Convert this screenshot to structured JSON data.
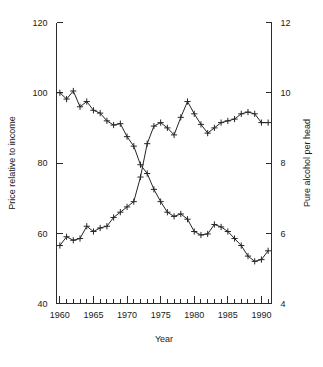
{
  "chart_data": {
    "type": "line",
    "title": "",
    "xlabel": "Year",
    "ylabel": "Price relative to income",
    "y2label": "Pure alcohol per head",
    "xlim": [
      1959.5,
      1991.5
    ],
    "ylim": [
      40,
      120
    ],
    "y2lim": [
      4,
      12
    ],
    "grid": false,
    "legend": "none",
    "x_ticks_major": [
      1960,
      1965,
      1970,
      1975,
      1980,
      1985,
      1990
    ],
    "x_tick_labels": [
      "1960",
      "1965",
      "1970",
      "1975",
      "1980",
      "1985",
      "1990"
    ],
    "x_ticks_minor_every": 1,
    "y_ticks": [
      40,
      60,
      80,
      100,
      120
    ],
    "y_tick_labels": [
      "40",
      "60",
      "80",
      "100",
      "120"
    ],
    "y2_ticks": [
      4,
      6,
      8,
      10,
      12
    ],
    "y2_tick_labels": [
      "4",
      "6",
      "8",
      "10",
      "12"
    ],
    "marker": "plus",
    "x": [
      1960,
      1961,
      1962,
      1963,
      1964,
      1965,
      1966,
      1967,
      1968,
      1969,
      1970,
      1971,
      1972,
      1973,
      1974,
      1975,
      1976,
      1977,
      1978,
      1979,
      1980,
      1981,
      1982,
      1983,
      1984,
      1985,
      1986,
      1987,
      1988,
      1989,
      1990,
      1991
    ],
    "series": [
      {
        "name": "Price relative to income",
        "axis": "left",
        "values": [
          100.0,
          98.2,
          100.5,
          96.0,
          97.5,
          95.0,
          94.2,
          92.0,
          90.8,
          91.2,
          87.5,
          84.8,
          79.5,
          77.0,
          72.5,
          69.0,
          66.0,
          64.8,
          65.5,
          64.0,
          60.5,
          59.5,
          59.8,
          62.5,
          61.8,
          60.5,
          58.5,
          56.5,
          53.5,
          52.0,
          52.5,
          55.0
        ]
      },
      {
        "name": "Pure alcohol per head",
        "axis": "right",
        "values": [
          5.65,
          5.9,
          5.8,
          5.85,
          6.2,
          6.05,
          6.15,
          6.2,
          6.45,
          6.6,
          6.75,
          6.9,
          7.6,
          8.55,
          9.05,
          9.15,
          9.0,
          8.8,
          9.3,
          9.75,
          9.4,
          9.1,
          8.85,
          9.0,
          9.15,
          9.2,
          9.25,
          9.4,
          9.45,
          9.4,
          9.15,
          9.15
        ]
      }
    ]
  },
  "axis_labels": {
    "left_title": "Price relative to income",
    "right_title": "Pure alcohol per head",
    "bottom_title": "Year"
  },
  "colors": {
    "line": "#262626",
    "axis": "#2b2b2b",
    "text": "#1a1a1a",
    "background": "#ffffff"
  }
}
